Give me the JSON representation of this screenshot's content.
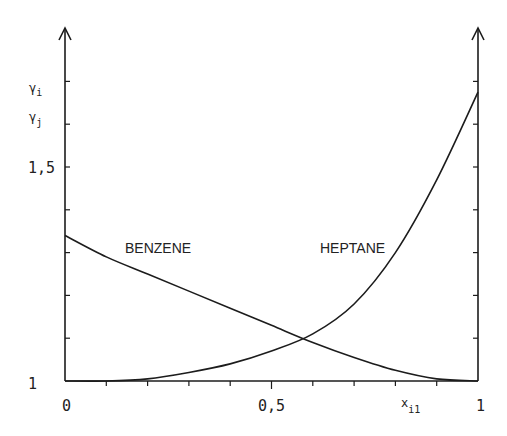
{
  "chart_data": {
    "type": "line",
    "title": "",
    "xlabel": "x_i1",
    "ylabel": "γ_i, γ_j",
    "xlim": [
      0,
      1
    ],
    "ylim": [
      1,
      1.7
    ],
    "grid": false,
    "legend": "inline curve labels",
    "x_ticks": [
      0,
      0.1,
      0.2,
      0.3,
      0.4,
      0.5,
      0.6,
      0.7,
      0.8,
      0.9,
      1
    ],
    "x_tick_labels": [
      {
        "value": 0,
        "label": "0"
      },
      {
        "value": 0.5,
        "label": "0,5"
      },
      {
        "value": 1,
        "label": "1"
      }
    ],
    "y_ticks": [
      1,
      1.1,
      1.2,
      1.3,
      1.4,
      1.5,
      1.6,
      1.7
    ],
    "y_tick_labels": [
      {
        "value": 1,
        "label": "1"
      },
      {
        "value": 1.5,
        "label": "1,5"
      }
    ],
    "x": [
      0,
      0.1,
      0.2,
      0.3,
      0.4,
      0.5,
      0.6,
      0.7,
      0.8,
      0.9,
      1.0
    ],
    "series": [
      {
        "name": "BENZENE",
        "values": [
          1.34,
          1.29,
          1.25,
          1.21,
          1.17,
          1.13,
          1.09,
          1.055,
          1.025,
          1.005,
          1.0
        ]
      },
      {
        "name": "HEPTANE",
        "values": [
          1.0,
          1.0,
          1.005,
          1.02,
          1.04,
          1.07,
          1.11,
          1.18,
          1.3,
          1.47,
          1.675
        ]
      }
    ],
    "annotations": [
      {
        "text": "BENZENE",
        "x": 0.15,
        "y": 1.25
      },
      {
        "text": "HEPTANE",
        "x": 0.62,
        "y": 1.25
      }
    ]
  },
  "labels": {
    "y_label_top": "γ",
    "y_label_top_sub": "i",
    "y_label_bottom": "γ",
    "y_label_bottom_sub": "j",
    "y_tick_1": "1",
    "y_tick_15": "1,5",
    "x_tick_0": "0",
    "x_tick_05": "0,5",
    "x_tick_1": "1",
    "x_label": "x",
    "x_label_sub": "i1",
    "benzene": "BENZENE",
    "heptane": "HEPTANE"
  }
}
